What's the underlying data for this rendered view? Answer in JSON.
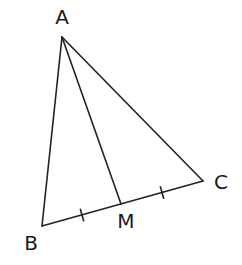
{
  "diagram": {
    "type": "triangle-with-median",
    "stroke_color": "#222222",
    "points": {
      "A": {
        "label": "A",
        "x": 62,
        "y": 37,
        "label_x": 62,
        "label_y": 24
      },
      "B": {
        "label": "B",
        "x": 42,
        "y": 226,
        "label_x": 31,
        "label_y": 250
      },
      "C": {
        "label": "C",
        "x": 203,
        "y": 181,
        "label_x": 221,
        "label_y": 189
      },
      "M": {
        "label": "M",
        "x": 121,
        "y": 204,
        "label_x": 126,
        "label_y": 228
      }
    },
    "segments": [
      {
        "name": "side-ab",
        "from": "A",
        "to": "B"
      },
      {
        "name": "side-ac",
        "from": "A",
        "to": "C"
      },
      {
        "name": "side-bc",
        "from": "B",
        "to": "C"
      },
      {
        "name": "median-am",
        "from": "A",
        "to": "M"
      }
    ],
    "tick_marks": [
      {
        "name": "tick-bm",
        "segment": "BM",
        "x": 82,
        "y": 215
      },
      {
        "name": "tick-mc",
        "segment": "MC",
        "x": 162,
        "y": 192.5
      }
    ]
  }
}
